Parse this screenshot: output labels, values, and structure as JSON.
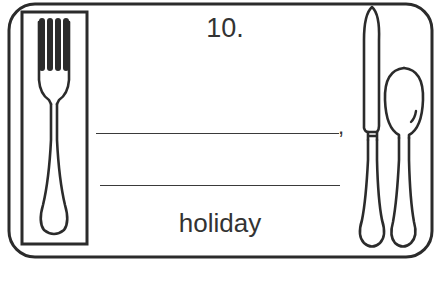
{
  "card": {
    "number_label": "10.",
    "line_1_suffix": ",",
    "word": "holiday",
    "icons": {
      "fork": "fork-icon",
      "knife": "knife-icon",
      "spoon": "spoon-icon"
    },
    "colors": {
      "stroke": "#2b2b2b",
      "text": "#333333",
      "background": "#ffffff"
    }
  }
}
